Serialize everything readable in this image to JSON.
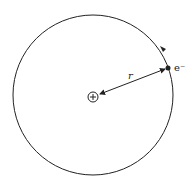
{
  "diagram": {
    "type": "bohr-atom-model",
    "orbit": {
      "cx": 93,
      "cy": 95,
      "r": 80,
      "stroke": "#222222"
    },
    "nucleus": {
      "cx": 93,
      "cy": 97,
      "r": 5,
      "symbol": "+"
    },
    "electron": {
      "cx": 168,
      "cy": 68,
      "r": 2.5,
      "label": "e⁻"
    },
    "radius_label": "r",
    "direction": "counterclockwise"
  }
}
